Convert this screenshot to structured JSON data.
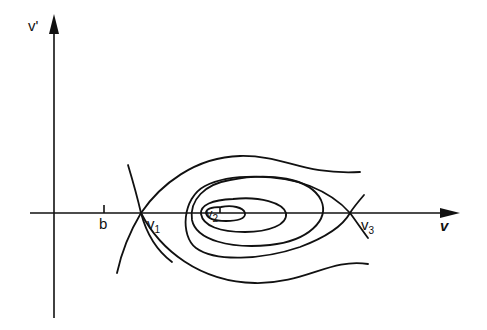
{
  "diagram": {
    "type": "phase-portrait",
    "axes": {
      "x_label": "v",
      "y_label": "v'"
    },
    "points": [
      {
        "id": "b",
        "label": "b",
        "kind": "tick"
      },
      {
        "id": "v1",
        "label": "v",
        "subscript": "1",
        "kind": "saddle"
      },
      {
        "id": "v2",
        "label": "v",
        "subscript": "2",
        "kind": "center"
      },
      {
        "id": "v3",
        "label": "v",
        "subscript": "3",
        "kind": "saddle"
      }
    ],
    "colors": {
      "ink": "#111111",
      "background": "#ffffff"
    }
  }
}
